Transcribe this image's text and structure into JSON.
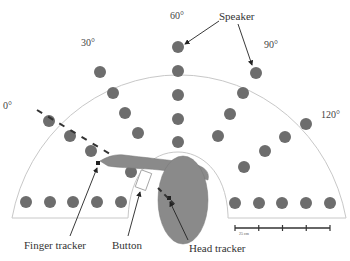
{
  "figure": {
    "angles": [
      {
        "label": "0°",
        "x": 2,
        "y": 101
      },
      {
        "label": "30°",
        "x": 82,
        "y": 38
      },
      {
        "label": "60°",
        "x": 171,
        "y": 13
      },
      {
        "label": "90°",
        "x": 264,
        "y": 40
      },
      {
        "label": "120°",
        "x": 320,
        "y": 108
      }
    ],
    "labels": {
      "speaker": "Speaker",
      "finger_tracker": "Finger tracker",
      "button": "Button",
      "head_tracker": "Head tracker",
      "scale": "25 cm"
    },
    "colors": {
      "speaker": "#6d6d6d",
      "arc": "#c8c8c8",
      "body": "#8a8a8a",
      "line": "#333333"
    },
    "speakers": {
      "deg0": [
        [
          49,
          121
        ],
        [
          70,
          136
        ],
        [
          91,
          151
        ],
        [
          131,
          172
        ]
      ],
      "deg30": [
        [
          100,
          72
        ],
        [
          113,
          93
        ],
        [
          125,
          113
        ],
        [
          138,
          133
        ]
      ],
      "deg60": [
        [
          178,
          47
        ],
        [
          178,
          71
        ],
        [
          178,
          95
        ],
        [
          178,
          119
        ],
        [
          178,
          142
        ]
      ],
      "deg90": [
        [
          256,
          73
        ],
        [
          243,
          93
        ],
        [
          230,
          114
        ],
        [
          218,
          136
        ]
      ],
      "deg120": [
        [
          306,
          124
        ],
        [
          285,
          137
        ],
        [
          265,
          151
        ],
        [
          244,
          167
        ]
      ],
      "bottom_left": [
        [
          26,
          202
        ],
        [
          50,
          202
        ],
        [
          73,
          202
        ],
        [
          97,
          202
        ],
        [
          121,
          202
        ]
      ],
      "bottom_right": [
        [
          235,
          203
        ],
        [
          259,
          203
        ],
        [
          282,
          203
        ],
        [
          306,
          203
        ],
        [
          330,
          203
        ]
      ]
    },
    "scale_bar": {
      "x1": 235,
      "x2": 330,
      "y": 228,
      "ticks": 5
    }
  }
}
